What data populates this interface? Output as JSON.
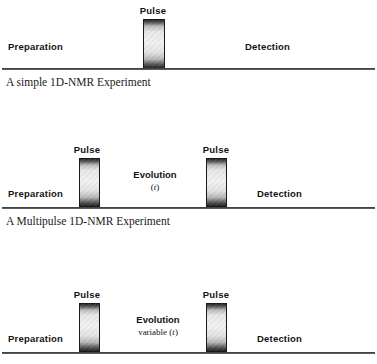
{
  "figure": {
    "line_color": "#2a2a2a",
    "pulse_fill_light": "#f2f2f2",
    "pulse_fill_dark": "#232323",
    "text_color": "#131313"
  },
  "diagrams": [
    {
      "name": "simple-1d-nmr",
      "caption": "A simple 1D-NMR Experiment",
      "preparation_label": "Preparation",
      "detection_label": "Detection",
      "pulses": [
        {
          "label": "Pulse"
        }
      ],
      "evolution": null
    },
    {
      "name": "multipulse-1d-nmr",
      "caption": "A Multipulse 1D-NMR Experiment",
      "preparation_label": "Preparation",
      "detection_label": "Detection",
      "pulses": [
        {
          "label": "Pulse"
        },
        {
          "label": "Pulse"
        }
      ],
      "evolution": {
        "title": "Evolution",
        "sub_prefix": "(",
        "sub_variable": "t",
        "sub_suffix": ")"
      }
    },
    {
      "name": "variable-evolution-1d-nmr",
      "caption": "",
      "preparation_label": "Preparation",
      "detection_label": "Detection",
      "pulses": [
        {
          "label": "Pulse"
        },
        {
          "label": "Pulse"
        }
      ],
      "evolution": {
        "title": "Evolution",
        "sub_prefix": "variable (",
        "sub_variable": "t",
        "sub_suffix": ")"
      }
    }
  ]
}
